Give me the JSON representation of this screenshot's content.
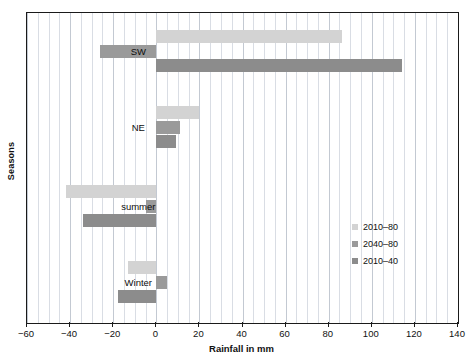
{
  "chart_data": {
    "type": "bar",
    "orientation": "horizontal",
    "title": "",
    "xlabel": "Rainfall in mm",
    "ylabel": "Seasons",
    "categories": [
      "SW",
      "NE",
      "summer",
      "Winter"
    ],
    "series": [
      {
        "name": "2010–80",
        "color": "#d3d3d3",
        "values": [
          86,
          20,
          -42,
          -13
        ]
      },
      {
        "name": "2040–80",
        "color": "#9a9a9a",
        "values": [
          -26,
          11,
          -5,
          5
        ]
      },
      {
        "name": "2010–40",
        "color": "#8c8c8c",
        "values": [
          114,
          9,
          -34,
          -18
        ]
      }
    ],
    "xlim": [
      -60,
      140
    ],
    "xticks": [
      -60,
      -40,
      -20,
      0,
      20,
      40,
      60,
      80,
      100,
      120,
      140
    ],
    "xtick_labels": [
      "−60",
      "−40",
      "−20",
      "0",
      "20",
      "40",
      "60",
      "80",
      "100",
      "120",
      "140"
    ],
    "minor_gridline_step": 5,
    "grid": true,
    "grid_axis": "x",
    "legend_position": "center-right"
  },
  "axes": {
    "x_title": "Rainfall in mm",
    "y_title": "Seasons"
  },
  "legend": {
    "items": [
      {
        "label": "2010–80"
      },
      {
        "label": "2040–80"
      },
      {
        "label": "2010–40"
      }
    ]
  },
  "category_labels": [
    {
      "text": "SW"
    },
    {
      "text": "NE"
    },
    {
      "text": "summer"
    },
    {
      "text": "Winter"
    }
  ]
}
